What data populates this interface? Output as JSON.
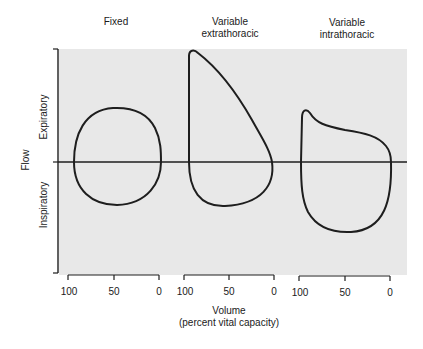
{
  "titles": {
    "fixed": "Fixed",
    "extrathoracic_line1": "Variable",
    "extrathoracic_line2": "extrathoracic",
    "intrathoracic_line1": "Variable",
    "intrathoracic_line2": "intrathoracic"
  },
  "y_axis": {
    "label": "Flow",
    "upper": "Expiratory",
    "lower": "Inspiratory"
  },
  "x_axis": {
    "label_line1": "Volume",
    "label_line2": "(percent vital capacity)",
    "scales": [
      {
        "name": "fixed",
        "ticks": [
          "100",
          "50",
          "0"
        ]
      },
      {
        "name": "extrathoracic",
        "ticks": [
          "100",
          "50",
          "0"
        ]
      },
      {
        "name": "intrathoracic",
        "ticks": [
          "100",
          "50",
          "0"
        ]
      }
    ]
  },
  "colors": {
    "plot_background": "#e8e8e8",
    "line": "#1e1e1e"
  },
  "loops": [
    {
      "name": "Fixed",
      "description": "Flattened expiratory and inspiratory limbs"
    },
    {
      "name": "Variable extrathoracic",
      "description": "Normal expiratory peak, flattened inspiratory limb"
    },
    {
      "name": "Variable intrathoracic",
      "description": "Flattened expiratory limb, normal inspiratory limb"
    }
  ]
}
